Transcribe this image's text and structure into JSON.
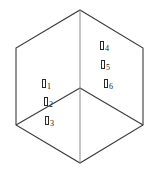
{
  "figure": {
    "name": "isometric-cube-diagram",
    "background_color": "#ffffff",
    "stroke_color": "#3a3a3a",
    "text_color": "#1a1a1a",
    "width": 157,
    "height": 180
  },
  "geometry": {
    "outline_points": "80,10 143,48 143,125 80,163 16,125 16,48",
    "center": {
      "x": 80,
      "y": 88
    },
    "spokes": [
      {
        "name": "spoke-up",
        "x1": 80,
        "y1": 88,
        "x2": 80,
        "y2": 10
      },
      {
        "name": "spoke-lower-left",
        "x1": 80,
        "y1": 88,
        "x2": 16,
        "y2": 125
      },
      {
        "name": "spoke-lower-right",
        "x1": 80,
        "y1": 88,
        "x2": 143,
        "y2": 125
      }
    ],
    "vertices": [
      {
        "name": "vertex-top",
        "x": 80,
        "y": 10
      },
      {
        "name": "vertex-upper-right",
        "x": 143,
        "y": 48
      },
      {
        "name": "vertex-lower-right",
        "x": 143,
        "y": 125
      },
      {
        "name": "vertex-bottom",
        "x": 80,
        "y": 163
      },
      {
        "name": "vertex-lower-left",
        "x": 16,
        "y": 125
      },
      {
        "name": "vertex-upper-left",
        "x": 16,
        "y": 48
      }
    ]
  },
  "labels": [
    {
      "id": "label-1",
      "glyph": "box-glyph",
      "subscript": "1",
      "x": 42,
      "y": 83
    },
    {
      "id": "label-2",
      "glyph": "box-glyph",
      "subscript": "2",
      "x": 44,
      "y": 101
    },
    {
      "id": "label-3",
      "glyph": "box-glyph",
      "subscript": "3",
      "x": 45,
      "y": 120
    },
    {
      "id": "label-4",
      "glyph": "box-glyph",
      "subscript": "4",
      "x": 100,
      "y": 45
    },
    {
      "id": "label-5",
      "glyph": "box-glyph",
      "subscript": "5",
      "x": 101,
      "y": 64
    },
    {
      "id": "label-6",
      "glyph": "box-glyph",
      "subscript": "6",
      "x": 104,
      "y": 83
    }
  ]
}
